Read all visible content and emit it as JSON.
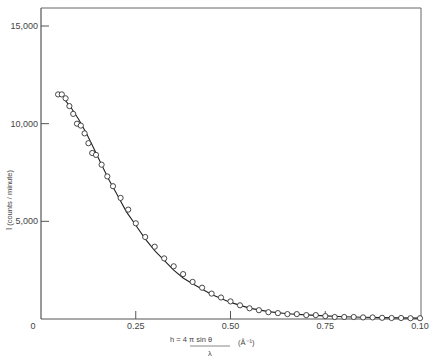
{
  "chart_data": {
    "type": "scatter",
    "title": "",
    "xlabel": "h = 4π sinθ / λ (Å⁻¹)",
    "xlabel_parts": {
      "numerator": "h = 4 π  sin θ",
      "denominator": "λ",
      "unit": "(Å⁻¹)"
    },
    "ylabel": "Ī (counts / minute)",
    "xlim": [
      0,
      1.0
    ],
    "ylim": [
      0,
      16000
    ],
    "x_ticks": [
      0,
      0.25,
      0.5,
      0.75,
      1.0
    ],
    "x_tick_labels": [
      "0",
      "0.25",
      "0.50",
      "0.75",
      "0.10"
    ],
    "y_ticks": [
      5000,
      10000,
      15000
    ],
    "y_tick_labels": [
      "5,000",
      "10,000",
      "15,000"
    ],
    "grid": false,
    "legend": null,
    "series": [
      {
        "name": "measured intensity",
        "style": "open-circle markers",
        "x": [
          0.045,
          0.055,
          0.065,
          0.075,
          0.085,
          0.095,
          0.105,
          0.115,
          0.125,
          0.135,
          0.145,
          0.16,
          0.175,
          0.19,
          0.21,
          0.23,
          0.25,
          0.275,
          0.3,
          0.325,
          0.35,
          0.375,
          0.4,
          0.425,
          0.45,
          0.475,
          0.5,
          0.525,
          0.55,
          0.575,
          0.6,
          0.625,
          0.65,
          0.675,
          0.7,
          0.725,
          0.75,
          0.775,
          0.8,
          0.825,
          0.85,
          0.875,
          0.9,
          0.925,
          0.95,
          0.975,
          1.0
        ],
        "y": [
          11500,
          11500,
          11300,
          10900,
          10500,
          10000,
          9900,
          9500,
          9000,
          8500,
          8400,
          7900,
          7300,
          6800,
          6200,
          5600,
          4900,
          4200,
          3700,
          3100,
          2700,
          2300,
          1900,
          1600,
          1300,
          1100,
          900,
          700,
          550,
          450,
          350,
          300,
          250,
          250,
          200,
          200,
          150,
          100,
          100,
          100,
          80,
          80,
          60,
          50,
          50,
          40,
          40
        ]
      },
      {
        "name": "fitted curve",
        "style": "solid line",
        "x": [
          0.06,
          0.08,
          0.1,
          0.12,
          0.14,
          0.16,
          0.18,
          0.2,
          0.225,
          0.25,
          0.275,
          0.3,
          0.325,
          0.35,
          0.375,
          0.4,
          0.45,
          0.5,
          0.55,
          0.6,
          0.65,
          0.7,
          0.75,
          0.8,
          0.85,
          0.9,
          0.95,
          1.0
        ],
        "y": [
          11300,
          10800,
          10200,
          9500,
          8700,
          7900,
          7100,
          6400,
          5500,
          4800,
          4100,
          3500,
          3000,
          2500,
          2100,
          1800,
          1250,
          850,
          560,
          380,
          270,
          210,
          160,
          120,
          90,
          70,
          55,
          45
        ]
      }
    ]
  }
}
